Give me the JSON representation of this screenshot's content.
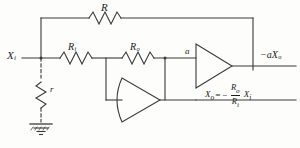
{
  "diagram": {
    "line_color": "#3a3a3a",
    "text_color": "#1c1c1c",
    "background": "#fdfdfb"
  },
  "labels": {
    "feedback_resistor": "R",
    "input_resistor_base": "R",
    "input_resistor_sub": "i",
    "output_resistor_base": "R",
    "output_resistor_sub": "o",
    "shunt_resistor": "r",
    "input_signal_base": "X",
    "input_signal_sub": "i",
    "node_gain": "a",
    "output_signal_base": "−aX",
    "output_signal_sub": "o"
  },
  "formula": {
    "lhs_base": "X",
    "lhs_sub": "o",
    "equals": "=",
    "minus": "−",
    "numerator_base": "R",
    "numerator_sub": "o",
    "denominator_base": "R",
    "denominator_sub": "i",
    "term_base": "X",
    "term_sub": "i"
  },
  "components": {
    "amplifier_right": "triangle-amplifier",
    "amplifier_lower": "triangle-amplifier-curved",
    "ground": "ground-symbol",
    "junction_nodes": 2
  }
}
